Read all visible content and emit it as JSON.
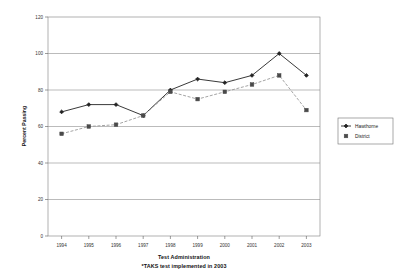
{
  "chart_data": {
    "type": "line",
    "title": "",
    "xlabel": "Test Administration",
    "xlabel_note": "*TAKS test implemented in 2003",
    "ylabel": "Percent Passing",
    "categories": [
      "1994",
      "1995",
      "1996",
      "1997",
      "1998",
      "1999",
      "2000",
      "2001",
      "2002",
      "2003"
    ],
    "ylim": [
      0,
      120
    ],
    "yticks": [
      0,
      20,
      40,
      60,
      80,
      100,
      120
    ],
    "ytick_labels": [
      "0",
      "20",
      "40",
      "60",
      "80",
      "100",
      "120"
    ],
    "grid": true,
    "legend_position": "right",
    "series": [
      {
        "name": "Hawthorne",
        "marker": "diamond",
        "line_style": "solid",
        "color": "#222222",
        "values": [
          68,
          72,
          72,
          66,
          80,
          86,
          84,
          88,
          100,
          88
        ]
      },
      {
        "name": "District",
        "marker": "square",
        "line_style": "dashed",
        "color": "#9a9a9a",
        "values": [
          56,
          60,
          61,
          66,
          79,
          75,
          79,
          83,
          88,
          69
        ]
      }
    ]
  },
  "legend": {
    "entries": [
      {
        "label": "Hawthorne"
      },
      {
        "label": "District"
      }
    ]
  },
  "colors": {
    "hawthorne": "#222222",
    "district": "#9a9a9a",
    "gridline": "#8d8d8d",
    "axis": "#555555",
    "background": "#ffffff"
  }
}
